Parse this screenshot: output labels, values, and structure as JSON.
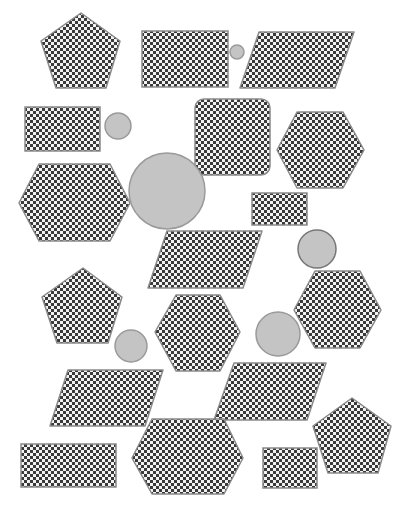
{
  "canvas": {
    "width": 407,
    "height": 511,
    "background": "#ffffff"
  },
  "colors": {
    "checker_dark": "#3a3a3a",
    "checker_light": "#f2f2f2",
    "shape_stroke": "#8a8a8a",
    "circle_fill": "#c4c4c4",
    "circle_stroke": "#9a9a9a",
    "circle_stroke_dark": "#777777"
  },
  "shapes": [
    {
      "type": "polygon",
      "name": "pentagon",
      "points": "81,13 120,41 106,88 56,88 41,41"
    },
    {
      "type": "rect",
      "name": "rectangle",
      "x": 142,
      "y": 31,
      "w": 86,
      "h": 56,
      "r": 0
    },
    {
      "type": "circle",
      "name": "circle-small",
      "cx": 237,
      "cy": 52,
      "r": 7
    },
    {
      "type": "polygon",
      "name": "parallelogram",
      "points": "259,32 354,32 335,88 240,88"
    },
    {
      "type": "rect",
      "name": "rectangle",
      "x": 25,
      "y": 107,
      "w": 75,
      "h": 44,
      "r": 0
    },
    {
      "type": "circle",
      "name": "circle-small",
      "cx": 118,
      "cy": 126,
      "r": 13
    },
    {
      "type": "rect",
      "name": "rounded-square",
      "x": 195,
      "y": 99,
      "w": 75,
      "h": 76,
      "r": 9
    },
    {
      "type": "polygon",
      "name": "hexagon",
      "points": "297,112 343,112 364,150 343,188 297,188 277,150"
    },
    {
      "type": "polygon",
      "name": "hexagon",
      "points": "39,164 110,164 130,203 110,241 39,241 19,203"
    },
    {
      "type": "circle",
      "name": "circle-large",
      "cx": 167,
      "cy": 191,
      "r": 38
    },
    {
      "type": "rect",
      "name": "rectangle",
      "x": 252,
      "y": 193,
      "w": 55,
      "h": 32,
      "r": 0
    },
    {
      "type": "polygon",
      "name": "parallelogram",
      "points": "167,231 262,231 243,288 148,288"
    },
    {
      "type": "circle",
      "name": "circle-medium",
      "cx": 317,
      "cy": 249,
      "r": 19
    },
    {
      "type": "polygon",
      "name": "pentagon",
      "points": "83,268 122,297 108,343 57,343 42,297"
    },
    {
      "type": "polygon",
      "name": "hexagon",
      "points": "176,295 220,295 240,332 220,371 176,371 155,332"
    },
    {
      "type": "polygon",
      "name": "hexagon",
      "points": "315,271 360,271 381,310 360,348 315,348 294,310"
    },
    {
      "type": "circle",
      "name": "circle-medium",
      "cx": 131,
      "cy": 346,
      "r": 16
    },
    {
      "type": "circle",
      "name": "circle-medium",
      "cx": 278,
      "cy": 334,
      "r": 22
    },
    {
      "type": "polygon",
      "name": "parallelogram",
      "points": "68,370 163,370 145,426 50,426"
    },
    {
      "type": "polygon",
      "name": "parallelogram",
      "points": "234,363 326,363 307,420 214,420"
    },
    {
      "type": "rect",
      "name": "rectangle",
      "x": 21,
      "y": 444,
      "w": 95,
      "h": 43,
      "r": 0
    },
    {
      "type": "polygon",
      "name": "hexagon",
      "points": "152,419 224,419 243,458 224,494 152,494 132,458"
    },
    {
      "type": "rect",
      "name": "rectangle",
      "x": 263,
      "y": 448,
      "w": 54,
      "h": 40,
      "r": 0
    },
    {
      "type": "polygon",
      "name": "pentagon",
      "points": "352,398 391,426 378,473 328,473 313,426"
    }
  ]
}
